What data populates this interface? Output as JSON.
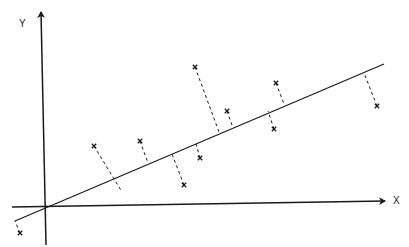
{
  "diagram": {
    "axes": {
      "x_label": "X",
      "y_label": "Y",
      "x_axis": {
        "x1": 12,
        "y1": 207,
        "x2": 385,
        "y2": 201
      },
      "y_axis": {
        "x1": 46,
        "y1": 245,
        "x2": 41,
        "y2": 12
      }
    },
    "regression_line": {
      "x1": 15,
      "y1": 221,
      "x2": 384,
      "y2": 64
    },
    "points": [
      {
        "px": 20,
        "py": 233,
        "fx": 15,
        "fy": 221
      },
      {
        "px": 94,
        "py": 146,
        "fx": 122,
        "fy": 192
      },
      {
        "px": 140,
        "py": 141,
        "fx": 148,
        "fy": 163
      },
      {
        "px": 184,
        "py": 185,
        "fx": 172,
        "fy": 154
      },
      {
        "px": 200,
        "py": 158,
        "fx": 196,
        "fy": 144
      },
      {
        "px": 195,
        "py": 67,
        "fx": 219,
        "fy": 132
      },
      {
        "px": 227,
        "py": 111,
        "fx": 232,
        "fy": 125
      },
      {
        "px": 276,
        "py": 83,
        "fx": 284,
        "fy": 104
      },
      {
        "px": 274,
        "py": 129,
        "fx": 268,
        "fy": 111
      },
      {
        "px": 377,
        "py": 106,
        "fx": 364,
        "fy": 73
      }
    ],
    "colors": {
      "ink": "#1a1a1a",
      "background": "#ffffff"
    }
  }
}
